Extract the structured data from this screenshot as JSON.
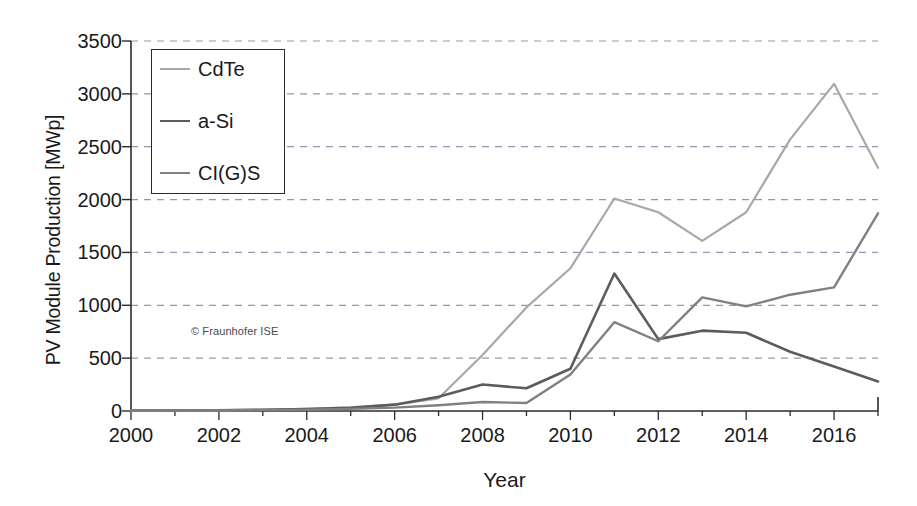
{
  "chart_data": {
    "type": "line",
    "title": "",
    "xlabel": "Year",
    "ylabel": "PV Module Production [MWp]",
    "xlim": [
      2000,
      2017
    ],
    "ylim": [
      0,
      3500
    ],
    "grid": true,
    "grid_axis": "y",
    "legend_position": "upper-left-inside",
    "watermark": "© Fraunhofer ISE",
    "x": [
      2000,
      2001,
      2002,
      2003,
      2004,
      2005,
      2006,
      2007,
      2008,
      2009,
      2010,
      2011,
      2012,
      2013,
      2014,
      2015,
      2016,
      2017
    ],
    "xticks": [
      2000,
      2002,
      2004,
      2006,
      2008,
      2010,
      2012,
      2014,
      2016
    ],
    "xtick_labels": [
      "2000",
      "2002",
      "2004",
      "2006",
      "2008",
      "2010",
      "2012",
      "2014",
      "2016"
    ],
    "yticks": [
      0,
      500,
      1000,
      1500,
      2000,
      2500,
      3000,
      3500
    ],
    "ytick_labels": [
      "0",
      "500",
      "1000",
      "1500",
      "2000",
      "2500",
      "3000",
      "3500"
    ],
    "series": [
      {
        "name": "CdTe",
        "color": "#a8a8a8",
        "width": 2.2,
        "values": [
          5,
          6,
          8,
          12,
          20,
          35,
          60,
          120,
          530,
          980,
          1350,
          2010,
          1880,
          1610,
          1880,
          2570,
          3095,
          2300
        ]
      },
      {
        "name": "a-Si",
        "color": "#5c5c5c",
        "width": 2.6,
        "values": [
          4,
          5,
          7,
          11,
          18,
          30,
          60,
          135,
          250,
          215,
          400,
          1300,
          680,
          760,
          740,
          560,
          420,
          280
        ]
      },
      {
        "name": "CI(G)S",
        "color": "#808080",
        "width": 2.4,
        "values": [
          3,
          4,
          5,
          8,
          12,
          20,
          32,
          55,
          85,
          75,
          345,
          840,
          660,
          1075,
          990,
          1100,
          1170,
          1870
        ]
      }
    ]
  },
  "legend": {
    "entries": [
      {
        "label": "CdTe"
      },
      {
        "label": "a-Si"
      },
      {
        "label": "CI(G)S"
      }
    ]
  },
  "axes": {
    "x_title": "Year",
    "y_title": "PV Module Production [MWp]"
  },
  "colors": {
    "axis": "#2b2b2b",
    "grid": "#8c9bb0",
    "background": "#ffffff",
    "text": "#1a1a1a"
  }
}
